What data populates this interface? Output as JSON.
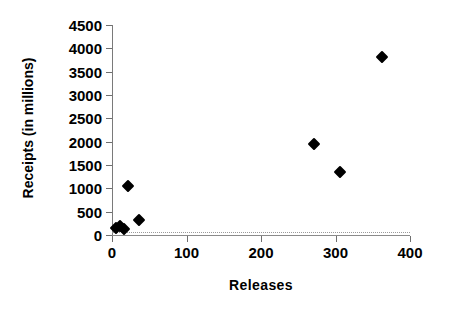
{
  "chart_data": {
    "type": "scatter",
    "title": "",
    "xlabel": "Releases",
    "ylabel": "Receipts (in millions)",
    "xlim": [
      0,
      400
    ],
    "ylim": [
      0,
      4500
    ],
    "xticks": [
      0,
      100,
      200,
      300,
      400
    ],
    "yticks": [
      0,
      500,
      1000,
      1500,
      2000,
      2500,
      3000,
      3500,
      4000,
      4500
    ],
    "grid": false,
    "legend": null,
    "marker": "diamond",
    "marker_color": "#000000",
    "points": [
      {
        "x": 6,
        "y": 150
      },
      {
        "x": 11,
        "y": 190
      },
      {
        "x": 16,
        "y": 130
      },
      {
        "x": 21,
        "y": 1060
      },
      {
        "x": 36,
        "y": 320
      },
      {
        "x": 271,
        "y": 1940
      },
      {
        "x": 306,
        "y": 1340
      },
      {
        "x": 362,
        "y": 3820
      }
    ]
  },
  "axis": {
    "x_tick_labels": [
      "0",
      "100",
      "200",
      "300",
      "400"
    ],
    "y_tick_labels": [
      "0",
      "500",
      "1000",
      "1500",
      "2000",
      "2500",
      "3000",
      "3500",
      "4000",
      "4500"
    ]
  }
}
